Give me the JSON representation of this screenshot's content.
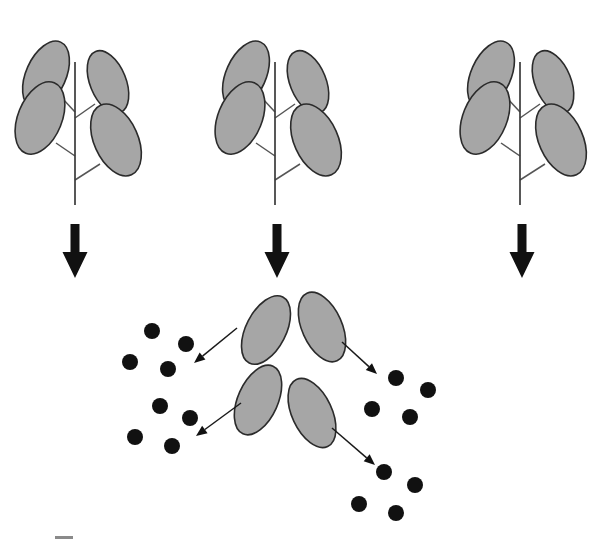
{
  "figure": {
    "width": 615,
    "height": 540,
    "background_color": "#ffffff"
  },
  "palette": {
    "leaf_fill": "#a6a6a6",
    "leaf_outline": "#2b2b2b",
    "stem": "#3a3a3a",
    "petiole": "#555555",
    "arrow": "#111111",
    "dot": "#111111"
  },
  "plants": [
    {
      "id": "plant-1",
      "label": "plant-left",
      "stem": {
        "x": 75,
        "y_top": 62,
        "y_bottom": 205
      },
      "leaves": [
        {
          "position": "upper-left",
          "cx": 46,
          "cy": 75,
          "rx": 20,
          "ry": 36,
          "rotate": 24,
          "petiole": [
            62,
            98,
            75,
            112
          ]
        },
        {
          "position": "upper-right",
          "cx": 108,
          "cy": 82,
          "rx": 18,
          "ry": 33,
          "rotate": -22,
          "petiole": [
            95,
            104,
            75,
            118
          ]
        },
        {
          "position": "mid-left",
          "cx": 40,
          "cy": 118,
          "rx": 22,
          "ry": 38,
          "rotate": 22,
          "petiole": [
            56,
            143,
            75,
            156
          ]
        },
        {
          "position": "lower-right",
          "cx": 116,
          "cy": 140,
          "rx": 22,
          "ry": 38,
          "rotate": -24,
          "petiole": [
            100,
            164,
            75,
            180
          ]
        }
      ]
    },
    {
      "id": "plant-2",
      "label": "plant-center",
      "stem": {
        "x": 275,
        "y_top": 62,
        "y_bottom": 205
      },
      "leaves": [
        {
          "position": "upper-left",
          "cx": 246,
          "cy": 75,
          "rx": 20,
          "ry": 36,
          "rotate": 24,
          "petiole": [
            262,
            98,
            275,
            112
          ]
        },
        {
          "position": "upper-right",
          "cx": 308,
          "cy": 82,
          "rx": 18,
          "ry": 33,
          "rotate": -22,
          "petiole": [
            295,
            104,
            275,
            118
          ]
        },
        {
          "position": "mid-left",
          "cx": 240,
          "cy": 118,
          "rx": 22,
          "ry": 38,
          "rotate": 22,
          "petiole": [
            256,
            143,
            275,
            156
          ]
        },
        {
          "position": "lower-right",
          "cx": 316,
          "cy": 140,
          "rx": 22,
          "ry": 38,
          "rotate": -24,
          "petiole": [
            300,
            164,
            275,
            180
          ]
        }
      ]
    },
    {
      "id": "plant-3",
      "label": "plant-right",
      "stem": {
        "x": 520,
        "y_top": 62,
        "y_bottom": 205
      },
      "leaves": [
        {
          "position": "upper-left",
          "cx": 491,
          "cy": 75,
          "rx": 20,
          "ry": 36,
          "rotate": 24,
          "petiole": [
            507,
            98,
            520,
            112
          ]
        },
        {
          "position": "upper-right",
          "cx": 553,
          "cy": 82,
          "rx": 18,
          "ry": 33,
          "rotate": -22,
          "petiole": [
            540,
            104,
            520,
            118
          ]
        },
        {
          "position": "mid-left",
          "cx": 485,
          "cy": 118,
          "rx": 22,
          "ry": 38,
          "rotate": 22,
          "petiole": [
            501,
            143,
            520,
            156
          ]
        },
        {
          "position": "lower-right",
          "cx": 561,
          "cy": 140,
          "rx": 22,
          "ry": 38,
          "rotate": -24,
          "petiole": [
            545,
            164,
            520,
            180
          ]
        }
      ]
    }
  ],
  "thick_arrows": [
    {
      "id": "thick-arrow-1",
      "label": "plant-1-to-sampling",
      "x": 75,
      "y_top": 224,
      "y_bottom": 278,
      "shaft_width": 9,
      "head_width": 25,
      "head_height": 26
    },
    {
      "id": "thick-arrow-2",
      "label": "plant-2-to-sampling",
      "x": 277,
      "y_top": 224,
      "y_bottom": 278,
      "shaft_width": 9,
      "head_width": 25,
      "head_height": 26
    },
    {
      "id": "thick-arrow-3",
      "label": "plant-3-to-sampling",
      "x": 522,
      "y_top": 224,
      "y_bottom": 278,
      "shaft_width": 9,
      "head_width": 25,
      "head_height": 26
    }
  ],
  "detached_leaves": [
    {
      "id": "detached-leaf-upper-left",
      "cx": 266,
      "cy": 330,
      "rx": 20,
      "ry": 37,
      "rotate": 27
    },
    {
      "id": "detached-leaf-upper-right",
      "cx": 322,
      "cy": 327,
      "rx": 20,
      "ry": 37,
      "rotate": -24
    },
    {
      "id": "detached-leaf-lower-left",
      "cx": 258,
      "cy": 400,
      "rx": 20,
      "ry": 37,
      "rotate": 24
    },
    {
      "id": "detached-leaf-lower-right",
      "cx": 312,
      "cy": 413,
      "rx": 20,
      "ry": 37,
      "rotate": -25
    }
  ],
  "thin_arrows": [
    {
      "id": "thin-arrow-to-cluster-upper-left",
      "from_leaf": "detached-leaf-upper-left",
      "to_cluster": "dot-cluster-upper-left",
      "x1": 237,
      "y1": 328,
      "x2": 194,
      "y2": 363
    },
    {
      "id": "thin-arrow-to-cluster-upper-right",
      "from_leaf": "detached-leaf-upper-right",
      "to_cluster": "dot-cluster-upper-right",
      "x1": 342,
      "y1": 342,
      "x2": 377,
      "y2": 374
    },
    {
      "id": "thin-arrow-to-cluster-lower-left",
      "from_leaf": "detached-leaf-lower-left",
      "to_cluster": "dot-cluster-lower-left",
      "x1": 241,
      "y1": 403,
      "x2": 196,
      "y2": 436
    },
    {
      "id": "thin-arrow-to-cluster-lower-right",
      "from_leaf": "detached-leaf-lower-right",
      "to_cluster": "dot-cluster-lower-right",
      "x1": 332,
      "y1": 428,
      "x2": 375,
      "y2": 465
    }
  ],
  "dot_clusters": [
    {
      "id": "dot-cluster-upper-left",
      "label": "sample-upper-left",
      "count": 4,
      "dots": [
        {
          "cx": 152,
          "cy": 331,
          "r": 8
        },
        {
          "cx": 186,
          "cy": 344,
          "r": 8
        },
        {
          "cx": 130,
          "cy": 362,
          "r": 8
        },
        {
          "cx": 168,
          "cy": 369,
          "r": 8
        }
      ]
    },
    {
      "id": "dot-cluster-lower-left",
      "label": "sample-lower-left",
      "count": 4,
      "dots": [
        {
          "cx": 160,
          "cy": 406,
          "r": 8
        },
        {
          "cx": 190,
          "cy": 418,
          "r": 8
        },
        {
          "cx": 135,
          "cy": 437,
          "r": 8
        },
        {
          "cx": 172,
          "cy": 446,
          "r": 8
        }
      ]
    },
    {
      "id": "dot-cluster-upper-right",
      "label": "sample-upper-right",
      "count": 4,
      "dots": [
        {
          "cx": 396,
          "cy": 378,
          "r": 8
        },
        {
          "cx": 428,
          "cy": 390,
          "r": 8
        },
        {
          "cx": 372,
          "cy": 409,
          "r": 8
        },
        {
          "cx": 410,
          "cy": 417,
          "r": 8
        }
      ]
    },
    {
      "id": "dot-cluster-lower-right",
      "label": "sample-lower-right",
      "count": 4,
      "dots": [
        {
          "cx": 384,
          "cy": 472,
          "r": 8
        },
        {
          "cx": 415,
          "cy": 485,
          "r": 8
        },
        {
          "cx": 359,
          "cy": 504,
          "r": 8
        },
        {
          "cx": 396,
          "cy": 513,
          "r": 8
        }
      ]
    }
  ],
  "caption": {
    "visible_fragment": "",
    "note": "cropped caption row at bottom edge"
  }
}
